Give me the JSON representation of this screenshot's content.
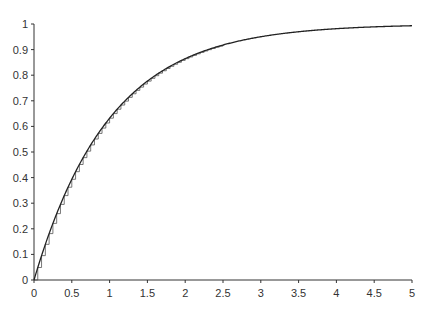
{
  "chart_data": {
    "type": "line",
    "title": "",
    "xlabel": "",
    "ylabel": "",
    "xlim": [
      0,
      5
    ],
    "ylim": [
      0,
      1
    ],
    "grid": false,
    "legend": null,
    "x_ticks": [
      "0",
      "0.5",
      "1",
      "1.5",
      "2",
      "2.5",
      "3",
      "3.5",
      "4",
      "4.5",
      "5"
    ],
    "y_ticks": [
      "0",
      "0.1",
      "0.2",
      "0.3",
      "0.4",
      "0.5",
      "0.6",
      "0.7",
      "0.8",
      "0.9",
      "1"
    ],
    "series": [
      {
        "name": "continuous curve",
        "style": "solid line",
        "function": "1 - exp(-x)",
        "x": [
          0,
          0.5,
          1,
          1.5,
          2,
          2.5,
          3,
          3.5,
          4,
          4.5,
          5
        ],
        "values": [
          0,
          0.39,
          0.63,
          0.78,
          0.86,
          0.92,
          0.95,
          0.97,
          0.98,
          0.99,
          0.99
        ]
      },
      {
        "name": "step approximation",
        "style": "staircase",
        "step_width": 0.05,
        "x_range": [
          0,
          2.5
        ],
        "description": "discrete steps lying just beneath the continuous curve"
      }
    ]
  },
  "colors": {
    "line": "#222222",
    "steps": "#555555",
    "axis": "#333333"
  }
}
